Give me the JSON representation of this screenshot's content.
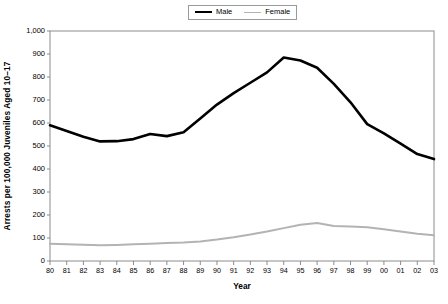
{
  "legend": {
    "position": "top-center",
    "entries": [
      {
        "label": "Male",
        "color": "#000000",
        "icon": "line-swatch-male"
      },
      {
        "label": "Female",
        "color": "#b3b3b3",
        "icon": "line-swatch-female"
      }
    ]
  },
  "chart_data": {
    "type": "line",
    "title": "",
    "subtitle": "",
    "xlabel": "Year",
    "ylabel": "Arrests per 100,000 Juveniles Aged 10–17",
    "x": [
      "80",
      "81",
      "82",
      "83",
      "84",
      "85",
      "86",
      "87",
      "88",
      "89",
      "90",
      "91",
      "92",
      "93",
      "94",
      "95",
      "96",
      "97",
      "98",
      "99",
      "00",
      "01",
      "02",
      "03"
    ],
    "xlim": [
      0,
      23
    ],
    "ylim": [
      0,
      1000
    ],
    "yticks": [
      0,
      100,
      200,
      300,
      400,
      500,
      600,
      700,
      800,
      900,
      1000
    ],
    "ytick_labels": [
      "0",
      "100",
      "200",
      "300",
      "400",
      "500",
      "600",
      "700",
      "800",
      "900",
      "1,000"
    ],
    "grid": false,
    "legend_position": "top-center",
    "series": [
      {
        "name": "Male",
        "color": "#000000",
        "width": 2.6,
        "values": [
          590,
          565,
          540,
          520,
          521,
          530,
          552,
          543,
          560,
          620,
          680,
          730,
          775,
          820,
          885,
          872,
          840,
          770,
          690,
          595,
          555,
          510,
          465,
          443
        ]
      },
      {
        "name": "Female",
        "color": "#b3b3b3",
        "width": 2.0,
        "values": [
          75,
          73,
          71,
          68,
          70,
          73,
          75,
          78,
          80,
          85,
          93,
          103,
          115,
          128,
          143,
          158,
          165,
          152,
          150,
          147,
          138,
          128,
          118,
          112
        ]
      }
    ]
  },
  "axes": {
    "x_title": "Year",
    "y_title": "Arrests per 100,000 Juveniles Aged 10–17"
  }
}
